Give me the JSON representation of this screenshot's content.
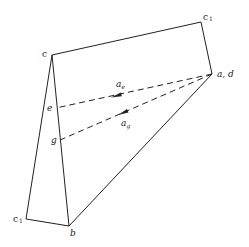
{
  "diagram": {
    "type": "geometric-figure",
    "labels": {
      "c_top_left": "c",
      "c1_top_right": "c",
      "c1_top_right_sub": "1",
      "a_d": "a, d",
      "e": "e",
      "g": "g",
      "c1_bottom_left": "c",
      "c1_bottom_left_sub": "1",
      "b": "b",
      "a_e": "a",
      "a_e_sub": "e",
      "a_g": "a",
      "a_g_sub": "g"
    },
    "points": {
      "c": [
        52,
        55
      ],
      "c1_top": [
        201,
        22
      ],
      "a_d": [
        212,
        74
      ],
      "e": [
        56,
        108
      ],
      "g": [
        60,
        140
      ],
      "c1_bottom": [
        26,
        219
      ],
      "b": [
        69,
        226
      ]
    },
    "edges": [
      [
        "c",
        "c1_top"
      ],
      [
        "c1_top",
        "a_d"
      ],
      [
        "c",
        "c1_bottom"
      ],
      [
        "c",
        "b"
      ],
      [
        "c1_bottom",
        "b"
      ],
      [
        "b",
        "a_d"
      ]
    ],
    "dashed_vectors": [
      {
        "from": "a_d",
        "to": "e",
        "label": "a_e"
      },
      {
        "from": "a_d",
        "to": "g",
        "label": "a_g"
      }
    ],
    "colors": {
      "stroke": "#222222",
      "background": "#ffffff"
    }
  }
}
